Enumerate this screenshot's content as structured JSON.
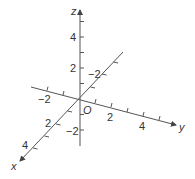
{
  "diagram": {
    "type": "3d-coordinate-axes",
    "origin_label": "O",
    "axes": [
      {
        "name": "x",
        "label": "x",
        "tick_labels": [
          {
            "value": 2,
            "text": "2"
          },
          {
            "value": 4,
            "text": "4"
          }
        ]
      },
      {
        "name": "y",
        "label": "y",
        "tick_labels": [
          {
            "value": -2,
            "text": "−2"
          },
          {
            "value": 2,
            "text": "2"
          },
          {
            "value": 4,
            "text": "4"
          }
        ]
      },
      {
        "name": "z",
        "label": "z",
        "tick_labels": [
          {
            "value": 4,
            "text": "4"
          },
          {
            "value": 2,
            "text": "2"
          },
          {
            "value": -2,
            "text": "−2"
          }
        ]
      }
    ],
    "x_back_tick_label": {
      "value": -2,
      "text": "−2"
    },
    "line_color": "#555555",
    "text_color": "#333333"
  }
}
